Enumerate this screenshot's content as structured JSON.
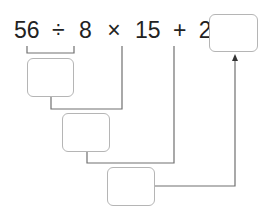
{
  "expression": {
    "tokens": [
      "56",
      "÷",
      "8",
      "×",
      "15",
      "+",
      "26",
      "="
    ]
  },
  "boxes": [
    {
      "id": "answer",
      "value": ""
    },
    {
      "id": "step1",
      "value": ""
    },
    {
      "id": "step2",
      "value": ""
    },
    {
      "id": "step3",
      "value": ""
    }
  ],
  "colors": {
    "line": "#707070",
    "box_border": "#b5b5b5",
    "text": "#222222"
  }
}
